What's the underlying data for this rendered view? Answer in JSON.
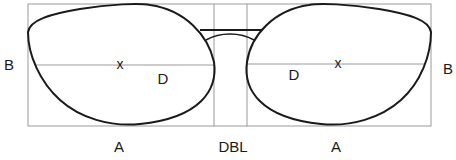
{
  "diagram": {
    "labels": {
      "lens_width_left": "A",
      "lens_width_right": "A",
      "lens_height_left": "B",
      "lens_height_right": "B",
      "bridge": "DBL",
      "diagonal_left": "D",
      "diagonal_right": "D",
      "optical_center_left": "x",
      "optical_center_right": "x"
    },
    "colors": {
      "frame_outline": "#1a1a1a",
      "guide_lines": "#9a9a9a",
      "text": "#1a1a1a"
    }
  }
}
